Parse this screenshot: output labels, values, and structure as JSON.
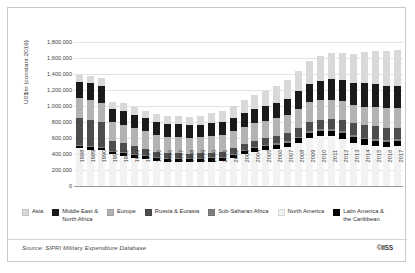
{
  "figure": {
    "source_note": "Source: SIPRI Military Expenditure Database",
    "copyright": "©IISS"
  },
  "legend": {
    "items": [
      {
        "label": "Asia",
        "color": "#d9d9d9"
      },
      {
        "label": "Middle East &\nNorth Africa",
        "color": "#1a1a1a"
      },
      {
        "label": "Europe",
        "color": "#b3b3b3"
      },
      {
        "label": "Russia & Eurasia",
        "color": "#4d4d4d"
      },
      {
        "label": "Sub-Saharan Africa",
        "color": "#7f7f7f"
      },
      {
        "label": "North America",
        "color": "#f2f2f2"
      },
      {
        "label": "Latin America &\nthe Caribbean",
        "color": "#000000"
      }
    ]
  },
  "chart_data": {
    "type": "bar",
    "stacked": true,
    "title": "",
    "xlabel": "",
    "ylabel": "US$m (constant 2016)",
    "ylim": [
      0,
      1800000
    ],
    "ytick_values": [
      0,
      200000,
      400000,
      600000,
      800000,
      1000000,
      1200000,
      1400000,
      1600000,
      1800000
    ],
    "ytick_labels": [
      "0",
      "200,000",
      "400,000",
      "600,000",
      "800,000",
      "1,000,000",
      "1,200,000",
      "1,400,000",
      "1,600,000",
      "1,800,000"
    ],
    "grid": true,
    "legend_position": "bottom",
    "categories": [
      "1988",
      "1989",
      "1990",
      "1991",
      "1992",
      "1993",
      "1994",
      "1995",
      "1996",
      "1997",
      "1998",
      "1999",
      "2000",
      "2001",
      "2002",
      "2003",
      "2004",
      "2005",
      "2006",
      "2007",
      "2008",
      "2009",
      "2010",
      "2011",
      "2012",
      "2013",
      "2014",
      "2015",
      "2016",
      "2017"
    ],
    "stack_order_bottom_to_top": [
      "North America",
      "Latin America & the Caribbean",
      "Sub-Saharan Africa",
      "Russia & Eurasia",
      "Europe",
      "Middle East & North Africa",
      "Asia"
    ],
    "series": [
      {
        "name": "North America",
        "color": "#f2f2f2",
        "values": [
          470000,
          455000,
          445000,
          395000,
          375000,
          355000,
          335000,
          315000,
          300000,
          300000,
          295000,
          300000,
          305000,
          310000,
          345000,
          395000,
          430000,
          450000,
          465000,
          485000,
          540000,
          600000,
          620000,
          620000,
          590000,
          540000,
          510000,
          495000,
          490000,
          500000
        ]
      },
      {
        "name": "Latin America & the Caribbean",
        "color": "#000000",
        "values": [
          36000,
          36000,
          36000,
          36000,
          37000,
          37000,
          38000,
          38000,
          39000,
          40000,
          41000,
          41000,
          42000,
          43000,
          44000,
          45000,
          47000,
          50000,
          53000,
          57000,
          61000,
          65000,
          68000,
          70000,
          72000,
          74000,
          74000,
          70000,
          66000,
          64000
        ]
      },
      {
        "name": "Sub-Saharan Africa",
        "color": "#7f7f7f",
        "values": [
          12000,
          12000,
          12000,
          11000,
          10000,
          10000,
          10000,
          10000,
          10000,
          10000,
          11000,
          11000,
          12000,
          12000,
          13000,
          13000,
          14000,
          15000,
          15000,
          16000,
          17000,
          18000,
          19000,
          19000,
          20000,
          21000,
          22000,
          21000,
          20000,
          20000
        ]
      },
      {
        "name": "Russia & Eurasia",
        "color": "#4d4d4d",
        "values": [
          330000,
          320000,
          305000,
          120000,
          110000,
          95000,
          85000,
          65000,
          60000,
          62000,
          52000,
          55000,
          60000,
          64000,
          68000,
          72000,
          76000,
          82000,
          90000,
          100000,
          110000,
          120000,
          122000,
          128000,
          140000,
          150000,
          158000,
          165000,
          155000,
          140000
        ]
      },
      {
        "name": "Europe",
        "color": "#b3b3b3",
        "values": [
          250000,
          250000,
          245000,
          240000,
          235000,
          225000,
          218000,
          212000,
          208000,
          205000,
          205000,
          205000,
          208000,
          210000,
          215000,
          218000,
          220000,
          222000,
          225000,
          230000,
          240000,
          248000,
          245000,
          240000,
          235000,
          232000,
          230000,
          232000,
          240000,
          248000
        ]
      },
      {
        "name": "Middle East & North Africa",
        "color": "#1a1a1a",
        "values": [
          205000,
          210000,
          212000,
          165000,
          170000,
          168000,
          160000,
          158000,
          155000,
          155000,
          155000,
          150000,
          155000,
          160000,
          165000,
          170000,
          175000,
          180000,
          190000,
          200000,
          215000,
          230000,
          245000,
          255000,
          265000,
          275000,
          290000,
          290000,
          285000,
          280000
        ]
      },
      {
        "name": "Asia",
        "color": "#d9d9d9",
        "values": [
          90000,
          95000,
          95000,
          90000,
          95000,
          95000,
          98000,
          100000,
          100000,
          105000,
          110000,
          115000,
          125000,
          135000,
          150000,
          165000,
          180000,
          195000,
          215000,
          240000,
          260000,
          285000,
          310000,
          325000,
          345000,
          365000,
          390000,
          415000,
          435000,
          455000
        ]
      }
    ]
  }
}
